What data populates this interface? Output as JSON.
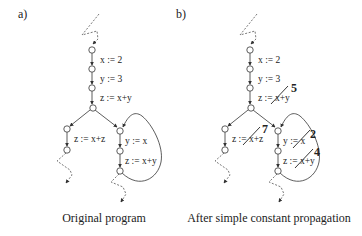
{
  "panels": [
    {
      "label": "a)",
      "caption": "Original program",
      "stmts": {
        "s1": "x := 2",
        "s2": "y := 3",
        "s3": "z := x+y",
        "left": "z := x+z",
        "right1": "y := x",
        "right2": "z := x+y"
      }
    },
    {
      "label": "b)",
      "caption": "After simple constant propagation",
      "stmts": {
        "s1": "x := 2",
        "s2": "y := 3",
        "s3": "z := x+y",
        "left": "z := x+z",
        "right1": "y := x",
        "right2": "z := x+y"
      },
      "replacements": {
        "s3": "5",
        "left": "7",
        "right1": "2",
        "right2": "4"
      }
    }
  ]
}
